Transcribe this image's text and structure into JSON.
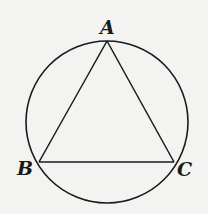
{
  "diagram": {
    "type": "inscribed-triangle-in-circle",
    "stroke_color": "#1a1a1a",
    "background_color": "#f3f3f1",
    "circle": {
      "cx": 107,
      "cy": 122,
      "r": 81
    },
    "vertices": {
      "A": {
        "label": "A",
        "x": 107,
        "y": 41
      },
      "B": {
        "label": "B",
        "x": 39,
        "y": 162
      },
      "C": {
        "label": "C",
        "x": 174,
        "y": 162
      }
    },
    "segments": [
      {
        "from": "A",
        "to": "B"
      },
      {
        "from": "A",
        "to": "C"
      },
      {
        "from": "B",
        "to": "C"
      }
    ]
  }
}
